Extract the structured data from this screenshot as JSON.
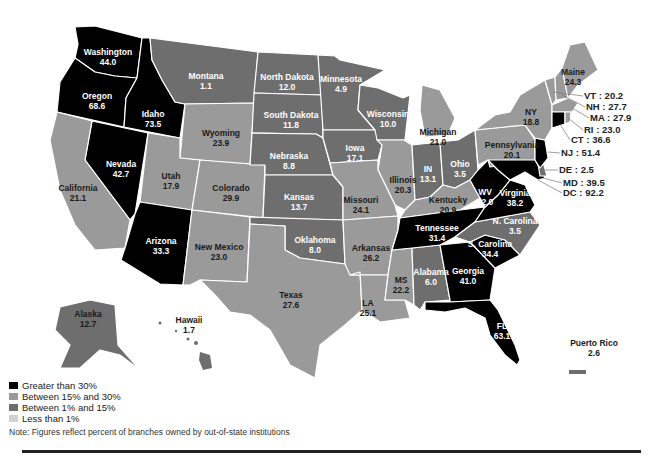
{
  "legend": {
    "items": [
      {
        "label": "Greater than 30%",
        "color": "#000000"
      },
      {
        "label": "Between 15% and 30%",
        "color": "#9a9a9a"
      },
      {
        "label": "Between 1% and 15%",
        "color": "#6e6e6e"
      },
      {
        "label": "Less than 1%",
        "color": "#d0d0d0"
      }
    ]
  },
  "note": "Note: Figures reflect percent of branches owned by out-of-state institutions",
  "states": {
    "WA": {
      "name": "Washington",
      "value": "44.0"
    },
    "OR": {
      "name": "Oregon",
      "value": "68.6"
    },
    "ID": {
      "name": "Idaho",
      "value": "73.5"
    },
    "MT": {
      "name": "Montana",
      "value": "1.1"
    },
    "ND": {
      "name": "North Dakota",
      "value": "12.0"
    },
    "MN": {
      "name": "Minnesota",
      "value": "4.9"
    },
    "WI": {
      "name": "Wisconsin",
      "value": "10.0"
    },
    "MI": {
      "name": "Michigan",
      "value": "21.0"
    },
    "NY": {
      "name": "NY",
      "value": "18.8"
    },
    "ME": {
      "name": "Maine",
      "value": "24.3"
    },
    "VT": {
      "name": "VT",
      "value": "20.2"
    },
    "NH": {
      "name": "NH",
      "value": "27.7"
    },
    "MA": {
      "name": "MA",
      "value": "27.9"
    },
    "RI": {
      "name": "RI",
      "value": "23.0"
    },
    "CT": {
      "name": "CT",
      "value": "36.6"
    },
    "NJ": {
      "name": "NJ",
      "value": "51.4"
    },
    "DE": {
      "name": "DE",
      "value": "2.5"
    },
    "MD": {
      "name": "MD",
      "value": "39.5"
    },
    "DC": {
      "name": "DC",
      "value": "92.2"
    },
    "WY": {
      "name": "Wyoming",
      "value": "23.9"
    },
    "SD": {
      "name": "South Dakota",
      "value": "11.8"
    },
    "IA": {
      "name": "Iowa",
      "value": "17.1"
    },
    "NE": {
      "name": "Nebraska",
      "value": "8.8"
    },
    "IL": {
      "name": "Illinois",
      "value": "20.3"
    },
    "IN": {
      "name": "IN",
      "value": "13.1"
    },
    "OH": {
      "name": "Ohio",
      "value": "3.5"
    },
    "PA": {
      "name": "Pennsylvania",
      "value": "20.1"
    },
    "NV": {
      "name": "Nevada",
      "value": "42.7"
    },
    "UT": {
      "name": "Utah",
      "value": "17.9"
    },
    "CO": {
      "name": "Colorado",
      "value": "29.9"
    },
    "CA": {
      "name": "California",
      "value": "21.1"
    },
    "KS": {
      "name": "Kansas",
      "value": "13.7"
    },
    "MO": {
      "name": "Missouri",
      "value": "24.1"
    },
    "KY": {
      "name": "Kentucky",
      "value": "20.9"
    },
    "WV": {
      "name": "WV",
      "value": "32.0"
    },
    "VA": {
      "name": "Virginia",
      "value": "38.2"
    },
    "AZ": {
      "name": "Arizona",
      "value": "33.3"
    },
    "NM": {
      "name": "New Mexico",
      "value": "23.0"
    },
    "OK": {
      "name": "Oklahoma",
      "value": "8.0"
    },
    "AR": {
      "name": "Arkansas",
      "value": "26.2"
    },
    "TN": {
      "name": "Tennessee",
      "value": "31.4"
    },
    "NC": {
      "name": "N. Carolina",
      "value": "3.5"
    },
    "SC": {
      "name": "S. Carolina",
      "value": "34.4"
    },
    "MS": {
      "name": "MS",
      "value": "22.2"
    },
    "AL": {
      "name": "Alabama",
      "value": "6.0"
    },
    "GA": {
      "name": "Georgia",
      "value": "41.0"
    },
    "TX": {
      "name": "Texas",
      "value": "27.6"
    },
    "LA": {
      "name": "LA",
      "value": "25.1"
    },
    "FL": {
      "name": "FL",
      "value": "63.1"
    },
    "AK": {
      "name": "Alaska",
      "value": "12.7"
    },
    "HI": {
      "name": "Hawaii",
      "value": "1.7"
    },
    "PR": {
      "name": "Puerto Rico",
      "value": "2.6"
    }
  },
  "colors": {
    "gt30": "#000000",
    "b15_30": "#9a9a9a",
    "b1_15": "#6e6e6e",
    "lt1": "#d0d0d0"
  }
}
